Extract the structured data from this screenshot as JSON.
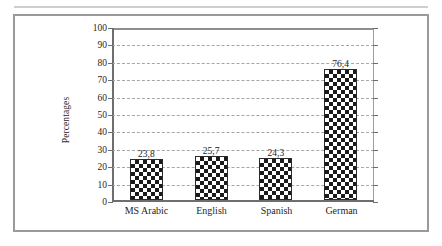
{
  "figure": {
    "frame_color": "#9a9a9a",
    "background": "#ffffff"
  },
  "chart_data": {
    "type": "bar",
    "title": "",
    "subtitle": "",
    "xlabel": "",
    "ylabel": "Percentages",
    "categories": [
      "MS Arabic",
      "English",
      "Spanish",
      "German"
    ],
    "values": [
      23.8,
      25.7,
      24.3,
      76.4
    ],
    "value_labels": [
      "23,8",
      "25,7",
      "24,3",
      "76,4"
    ],
    "ylim": [
      0,
      100
    ],
    "ytick_step": 10,
    "ytick_labels": [
      "100",
      "90",
      "80",
      "70",
      "60",
      "50",
      "40",
      "30",
      "20",
      "10",
      "0"
    ],
    "ytick_values": [
      100,
      90,
      80,
      70,
      60,
      50,
      40,
      30,
      20,
      10,
      0
    ],
    "grid": true,
    "grid_style": "dashed",
    "grid_color": "#a6a6a6",
    "legend": false,
    "legend_position": "none",
    "series": [
      {
        "name": "Percentages",
        "values": [
          23.8,
          25.7,
          24.3,
          76.4
        ],
        "fill": "checkerboard",
        "fill_colors": [
          "#1b1b1b",
          "#ffffff"
        ],
        "border_color": "#2a2a2a"
      }
    ],
    "annotations": []
  }
}
